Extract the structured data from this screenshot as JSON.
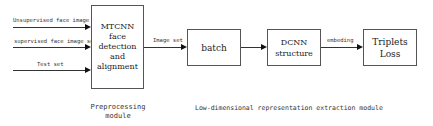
{
  "diagram": {
    "inputs": [
      {
        "label": "Unsupervised face image set"
      },
      {
        "label": "supervised face image set"
      },
      {
        "label": "Test set"
      }
    ],
    "nodes": {
      "mtcnn": {
        "line1": "MTCNN face",
        "line2": "detection and",
        "line3": "alignment"
      },
      "batch": {
        "label": "batch"
      },
      "dcnn": {
        "line1": "DCNN",
        "line2": "structure"
      },
      "triplets": {
        "line1": "Triplets",
        "line2": "Loss"
      }
    },
    "edges": {
      "mtcnn_to_batch": "Image set",
      "dcnn_to_triplets": "embeding"
    },
    "modules": {
      "preprocessing": {
        "line1": "Preprocessing",
        "line2": "module"
      },
      "extraction": "Low-dimensional representation extraction module"
    }
  }
}
